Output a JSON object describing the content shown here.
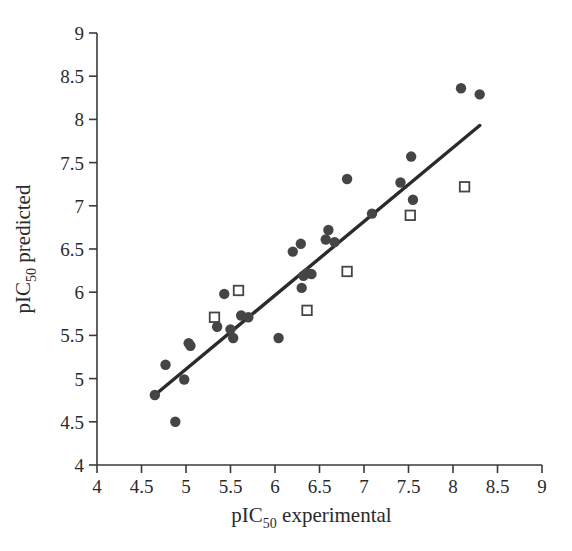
{
  "chart_data": {
    "type": "scatter",
    "title": "",
    "xlabel": "pIC50 experimental",
    "ylabel": "pIC50 predicted",
    "xlabel_main": "pIC",
    "xlabel_sub": "50",
    "xlabel_rest": " experimental",
    "ylabel_main": "pIC",
    "ylabel_sub": "50",
    "ylabel_rest": " predicted",
    "xlim": [
      4,
      9
    ],
    "ylim": [
      4,
      9
    ],
    "xticks": [
      4,
      4.5,
      5,
      5.5,
      6,
      6.5,
      7,
      7.5,
      8,
      8.5,
      9
    ],
    "yticks": [
      4,
      4.5,
      5,
      5.5,
      6,
      6.5,
      7,
      7.5,
      8,
      8.5,
      9
    ],
    "xtick_labels": [
      "4",
      "4.5",
      "5",
      "5.5",
      "6",
      "6.5",
      "7",
      "7.5",
      "8",
      "8.5",
      "9"
    ],
    "ytick_labels": [
      "4",
      "4.5",
      "5",
      "5.5",
      "6",
      "6.5",
      "7",
      "7.5",
      "8",
      "8.5",
      "9"
    ],
    "grid": false,
    "legend": "none",
    "marker_colors": {
      "filled_circle": "#454545",
      "open_square_edge": "#454545",
      "open_square_fill": "#ffffff",
      "trend_line": "#2b2b2b",
      "axis": "#3a3a3a"
    },
    "series": [
      {
        "name": "training set",
        "marker": "filled-circle",
        "points": [
          [
            4.65,
            4.81
          ],
          [
            4.77,
            5.16
          ],
          [
            4.88,
            4.5
          ],
          [
            4.98,
            4.99
          ],
          [
            5.03,
            5.41
          ],
          [
            5.05,
            5.38
          ],
          [
            5.35,
            5.6
          ],
          [
            5.43,
            5.98
          ],
          [
            5.5,
            5.57
          ],
          [
            5.53,
            5.47
          ],
          [
            5.62,
            5.73
          ],
          [
            5.7,
            5.71
          ],
          [
            6.04,
            5.47
          ],
          [
            6.2,
            6.47
          ],
          [
            6.29,
            6.56
          ],
          [
            6.3,
            6.05
          ],
          [
            6.32,
            6.19
          ],
          [
            6.36,
            6.22
          ],
          [
            6.41,
            6.21
          ],
          [
            6.57,
            6.61
          ],
          [
            6.6,
            6.72
          ],
          [
            6.67,
            6.58
          ],
          [
            6.81,
            7.31
          ],
          [
            7.09,
            6.91
          ],
          [
            7.41,
            7.27
          ],
          [
            7.53,
            7.57
          ],
          [
            7.55,
            7.07
          ],
          [
            8.09,
            8.36
          ],
          [
            8.3,
            8.29
          ]
        ]
      },
      {
        "name": "test set",
        "marker": "open-square",
        "points": [
          [
            5.32,
            5.71
          ],
          [
            5.59,
            6.02
          ],
          [
            6.36,
            5.79
          ],
          [
            6.81,
            6.24
          ],
          [
            7.52,
            6.89
          ],
          [
            8.13,
            7.22
          ]
        ]
      }
    ],
    "trend_line": {
      "x0": 4.65,
      "y0": 4.81,
      "x1": 8.3,
      "y1": 7.93
    }
  }
}
